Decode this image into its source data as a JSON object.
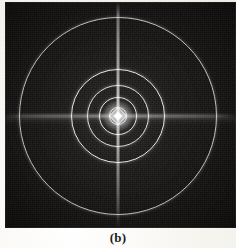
{
  "figure": {
    "caption": "(b)",
    "panel_label": "b",
    "background_color": "#13110f",
    "feature_color": "#ffffff",
    "page_color": "#f6f4ef"
  },
  "chart_data": {
    "type": "scatter",
    "title": "(b)",
    "subtitle": "",
    "xlabel": "",
    "ylabel": "",
    "plot_style": "dark-field image",
    "grid": false,
    "legend_position": "none",
    "center": {
      "x": 113,
      "y": 114
    },
    "units": "pixels",
    "xlim": [
      0,
      231
    ],
    "ylim": [
      0,
      226
    ],
    "annotations": [
      {
        "name": "central-maximum",
        "x": 113,
        "y": 114,
        "label": "bright central core"
      },
      {
        "name": "vertical-streak",
        "x": 113,
        "y": 114,
        "label": "vertical intensity streak"
      },
      {
        "name": "horizontal-streak",
        "x": 113,
        "y": 114,
        "label": "horizontal intensity streak"
      }
    ],
    "series": [
      {
        "name": "concentric rings",
        "kind": "rings",
        "radii": [
          9,
          19,
          31,
          47,
          99
        ],
        "values": [
          9,
          19,
          31,
          47,
          99
        ],
        "categories": [
          "ring 1",
          "ring 2",
          "ring 3",
          "ring 4",
          "ring 5"
        ],
        "ring_brightness": [
          0.92,
          0.88,
          0.85,
          0.9,
          0.82
        ],
        "ring_thickness": [
          1.3,
          1.3,
          1.4,
          1.6,
          1.5
        ]
      }
    ]
  }
}
